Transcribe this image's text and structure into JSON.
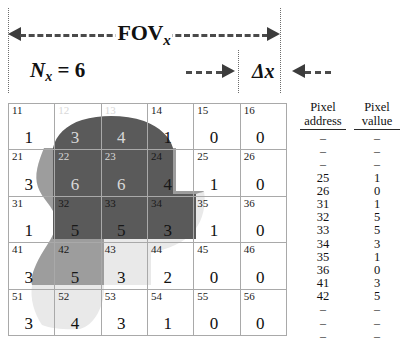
{
  "annotations": {
    "fov": {
      "text": "FOV",
      "subscript": "x",
      "left_arrow_icon": "arrow-left-icon",
      "right_arrow_icon": "arrow-right-icon"
    },
    "nx": {
      "symbol": "N",
      "subscript": "x",
      "equals_value": " = 6",
      "full_text": "Nx = 6"
    },
    "dx": {
      "text": "Δx",
      "in_arrow_icon": "arrow-right-icon",
      "out_arrow_icon": "arrow-left-icon"
    }
  },
  "grid": {
    "columns": 6,
    "rows": 5,
    "cells": [
      [
        {
          "address": "11",
          "value": "1",
          "shade": "none"
        },
        {
          "address": "12",
          "value": "3",
          "shade": "dark"
        },
        {
          "address": "13",
          "value": "4",
          "shade": "dark"
        },
        {
          "address": "14",
          "value": "1",
          "shade": "none"
        },
        {
          "address": "15",
          "value": "0",
          "shade": "none"
        },
        {
          "address": "16",
          "value": "0",
          "shade": "none"
        }
      ],
      [
        {
          "address": "21",
          "value": "3",
          "shade": "light"
        },
        {
          "address": "22",
          "value": "6",
          "shade": "dark"
        },
        {
          "address": "23",
          "value": "6",
          "shade": "dark"
        },
        {
          "address": "24",
          "value": "4",
          "shade": "mid"
        },
        {
          "address": "25",
          "value": "1",
          "shade": "none"
        },
        {
          "address": "26",
          "value": "0",
          "shade": "none"
        }
      ],
      [
        {
          "address": "31",
          "value": "1",
          "shade": "none"
        },
        {
          "address": "32",
          "value": "5",
          "shade": "mid"
        },
        {
          "address": "33",
          "value": "5",
          "shade": "mid"
        },
        {
          "address": "34",
          "value": "3",
          "shade": "none"
        },
        {
          "address": "35",
          "value": "1",
          "shade": "none"
        },
        {
          "address": "36",
          "value": "0",
          "shade": "none"
        }
      ],
      [
        {
          "address": "41",
          "value": "3",
          "shade": "light"
        },
        {
          "address": "42",
          "value": "5",
          "shade": "mid"
        },
        {
          "address": "43",
          "value": "3",
          "shade": "none"
        },
        {
          "address": "44",
          "value": "2",
          "shade": "none"
        },
        {
          "address": "45",
          "value": "0",
          "shade": "none"
        },
        {
          "address": "46",
          "value": "0",
          "shade": "none"
        }
      ],
      [
        {
          "address": "51",
          "value": "3",
          "shade": "light"
        },
        {
          "address": "52",
          "value": "4",
          "shade": "light"
        },
        {
          "address": "53",
          "value": "3",
          "shade": "none"
        },
        {
          "address": "54",
          "value": "1",
          "shade": "none"
        },
        {
          "address": "55",
          "value": "0",
          "shade": "none"
        },
        {
          "address": "56",
          "value": "0",
          "shade": "none"
        }
      ]
    ]
  },
  "lookup_table": {
    "headers": {
      "col1_line1": "Pixel",
      "col1_line2": "address",
      "col2_line1": "Pixel",
      "col2_line2": "vallue"
    },
    "rows": [
      {
        "address": "–",
        "value": "–"
      },
      {
        "address": "–",
        "value": "–"
      },
      {
        "address": "–",
        "value": "–"
      },
      {
        "address": "25",
        "value": "1"
      },
      {
        "address": "26",
        "value": "0"
      },
      {
        "address": "31",
        "value": "1"
      },
      {
        "address": "32",
        "value": "5"
      },
      {
        "address": "33",
        "value": "5"
      },
      {
        "address": "34",
        "value": "3"
      },
      {
        "address": "35",
        "value": "1"
      },
      {
        "address": "36",
        "value": "0"
      },
      {
        "address": "41",
        "value": "3"
      },
      {
        "address": "42",
        "value": "5"
      },
      {
        "address": "–",
        "value": "–"
      },
      {
        "address": "–",
        "value": "–"
      },
      {
        "address": "–",
        "value": "–"
      }
    ]
  },
  "colors": {
    "shade_dark": "#5a5a5a",
    "shade_mid": "#9d9d9d",
    "shade_light": "#e9e9e9",
    "background": "#ffffff",
    "grid_line": "#a9a9a9",
    "arrow": "#3c3c3c",
    "text": "#111111"
  }
}
